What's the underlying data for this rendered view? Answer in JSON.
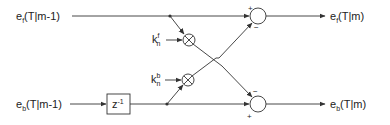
{
  "diagram": {
    "type": "lattice filter stage block diagram",
    "inputs": {
      "forward": {
        "base": "e",
        "sub": "f",
        "arg": "(T|m-1)"
      },
      "backward": {
        "base": "e",
        "sub": "b",
        "arg": "(T|m-1)"
      }
    },
    "outputs": {
      "forward": {
        "base": "e",
        "sub": "f",
        "arg": "(T|m)"
      },
      "backward": {
        "base": "e",
        "sub": "b",
        "arg": "(T|m)"
      }
    },
    "delay_block": {
      "label": "z",
      "exp": "-1"
    },
    "coefficients": {
      "forward": {
        "base": "k",
        "sub": "n",
        "sup": "f"
      },
      "backward": {
        "base": "k",
        "sub": "n",
        "sup": "b"
      }
    },
    "summers": {
      "top": {
        "plus": "+",
        "minus": "−"
      },
      "bottom": {
        "plus": "+",
        "minus": "−"
      }
    },
    "multiplier_symbol": "⊗"
  }
}
